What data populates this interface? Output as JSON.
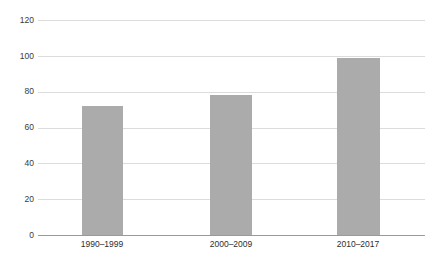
{
  "chart_data": {
    "type": "bar",
    "title": "",
    "subtitle": "",
    "xlabel": "",
    "ylabel": "",
    "categories": [
      "1990–1999",
      "2000–2009",
      "2010–2017"
    ],
    "values": [
      72,
      78,
      99
    ],
    "ylim": [
      0,
      120
    ],
    "yticks": [
      0,
      20,
      40,
      60,
      80,
      100,
      120
    ],
    "ytick_labels": [
      "0",
      "20",
      "40",
      "60",
      "80",
      "100",
      "120"
    ],
    "grid": true,
    "legend": null,
    "legend_position": "none",
    "annotations": [],
    "bar_color": "#ababab",
    "gridline_color": "#dcdcdc",
    "axis_color": "#9a9a9a",
    "label_color": "#2e2e2e",
    "background_color": "#ffffff"
  }
}
